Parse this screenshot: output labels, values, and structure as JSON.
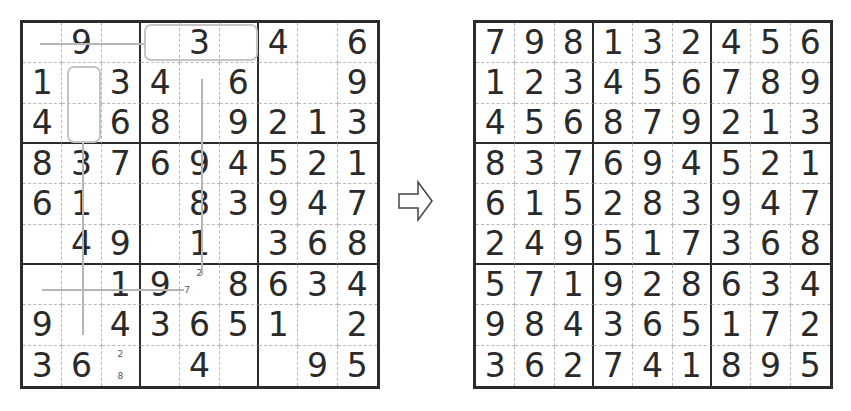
{
  "puzzle": {
    "givens": [
      [
        "",
        "9",
        "",
        "",
        "3",
        "",
        "4",
        "",
        "6"
      ],
      [
        "1",
        "",
        "3",
        "4",
        "",
        "6",
        "",
        "",
        "9"
      ],
      [
        "4",
        "",
        "6",
        "8",
        "",
        "9",
        "2",
        "1",
        "3"
      ],
      [
        "8",
        "3",
        "7",
        "6",
        "9",
        "4",
        "5",
        "2",
        "1"
      ],
      [
        "6",
        "1",
        "",
        "",
        "8",
        "3",
        "9",
        "4",
        "7"
      ],
      [
        "",
        "4",
        "9",
        "",
        "1",
        "",
        "3",
        "6",
        "8"
      ],
      [
        "",
        "",
        "1",
        "9",
        "",
        "8",
        "6",
        "3",
        "4"
      ],
      [
        "9",
        "",
        "4",
        "3",
        "6",
        "5",
        "1",
        "",
        "2"
      ],
      [
        "3",
        "6",
        "",
        "",
        "4",
        "",
        "",
        "9",
        "5"
      ]
    ],
    "pencil_marks": [
      {
        "row": 7,
        "col": 5,
        "marks": [
          {
            "value": "2",
            "pos": "top"
          },
          {
            "value": "7",
            "pos": "bottom-left"
          }
        ]
      },
      {
        "row": 9,
        "col": 3,
        "marks": [
          {
            "value": "2",
            "pos": "top"
          },
          {
            "value": "8",
            "pos": "bottom"
          }
        ]
      }
    ],
    "highlights": {
      "rects": [
        {
          "label": "row1-cols4-6",
          "row_start": 1,
          "row_end": 1,
          "col_start": 4,
          "col_end": 6
        },
        {
          "label": "col2-rows2-3",
          "row_start": 2,
          "row_end": 3,
          "col_start": 2,
          "col_end": 2
        }
      ],
      "lines": [
        {
          "label": "row1-horizontal",
          "orientation": "horizontal"
        },
        {
          "label": "col2-vertical",
          "orientation": "vertical"
        },
        {
          "label": "col5-vertical",
          "orientation": "vertical"
        },
        {
          "label": "row7-horizontal",
          "orientation": "horizontal"
        }
      ]
    }
  },
  "solution": {
    "grid": [
      [
        "7",
        "9",
        "8",
        "1",
        "3",
        "2",
        "4",
        "5",
        "6"
      ],
      [
        "1",
        "2",
        "3",
        "4",
        "5",
        "6",
        "7",
        "8",
        "9"
      ],
      [
        "4",
        "5",
        "6",
        "8",
        "7",
        "9",
        "2",
        "1",
        "3"
      ],
      [
        "8",
        "3",
        "7",
        "6",
        "9",
        "4",
        "5",
        "2",
        "1"
      ],
      [
        "6",
        "1",
        "5",
        "2",
        "8",
        "3",
        "9",
        "4",
        "7"
      ],
      [
        "2",
        "4",
        "9",
        "5",
        "1",
        "7",
        "3",
        "6",
        "8"
      ],
      [
        "5",
        "7",
        "1",
        "9",
        "2",
        "8",
        "6",
        "3",
        "4"
      ],
      [
        "9",
        "8",
        "4",
        "3",
        "6",
        "5",
        "1",
        "7",
        "2"
      ],
      [
        "3",
        "6",
        "2",
        "7",
        "4",
        "1",
        "8",
        "9",
        "5"
      ]
    ]
  },
  "arrow": {
    "icon": "right-arrow-outline",
    "direction": "right"
  },
  "colors": {
    "grid_line": "#2b2b2b",
    "minor_line": "#b8b8b8",
    "highlight": "#c4c4c4",
    "digit": "#2a2a2a"
  }
}
